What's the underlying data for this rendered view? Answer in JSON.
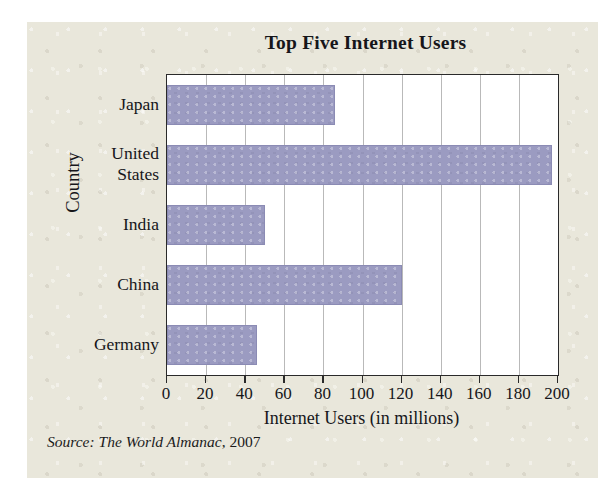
{
  "chart_data": {
    "type": "bar",
    "orientation": "horizontal",
    "title": "Top Five Internet Users",
    "xlabel": "Internet Users (in millions)",
    "ylabel": "Country",
    "categories": [
      "Japan",
      "United States",
      "India",
      "China",
      "Germany"
    ],
    "values": [
      86,
      197,
      50,
      120,
      46
    ],
    "xlim": [
      0,
      200
    ],
    "xticks": [
      0,
      20,
      40,
      60,
      80,
      100,
      120,
      140,
      160,
      180,
      200
    ],
    "xtick_labels": [
      "0",
      "20",
      "40",
      "60",
      "80",
      "100",
      "120",
      "140",
      "160",
      "180",
      "200"
    ],
    "grid": "vertical",
    "legend": "none",
    "bar_color": "#9b9bc1",
    "bar_edge_color": "#8b8bb4",
    "plot_background": "#ffffff",
    "frame_color": "#2a2a2a",
    "gridline_color": "#b9b9b9",
    "page_background": "#e9e7db"
  },
  "category_label_lines": [
    [
      "Japan"
    ],
    [
      "United",
      "States"
    ],
    [
      "India"
    ],
    [
      "China"
    ],
    [
      "Germany"
    ]
  ],
  "source": {
    "prefix": "Source:",
    "publication": "The World Almanac",
    "separator": ",",
    "year": "2007"
  }
}
